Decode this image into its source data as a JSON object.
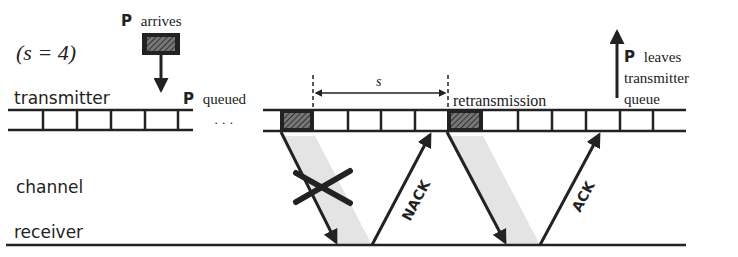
{
  "diagram": {
    "parameter_label": "(s = 4)",
    "labels": {
      "packet_bold": "P",
      "arrives": "arrives",
      "queued": "queued",
      "leaves_line1": "leaves",
      "leaves_line2": "transmitter",
      "leaves_line3": "queue",
      "ellipsis": "· · ·",
      "interval": "s",
      "retransmission": "retransmission",
      "nack": "NACK",
      "ack": "ACK"
    },
    "rows": {
      "transmitter": "transmitter",
      "channel": "channel",
      "receiver": "receiver"
    },
    "colors": {
      "line": "#222222",
      "packet_fill": "#333333",
      "shade": "#e4e4e4"
    }
  }
}
